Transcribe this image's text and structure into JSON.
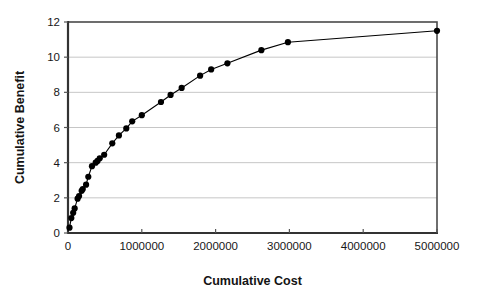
{
  "chart_data": {
    "type": "scatter",
    "title": "",
    "xlabel": "Cumulative Cost",
    "ylabel": "Cumulative Benefit",
    "xlim": [
      0,
      5000000
    ],
    "ylim": [
      0,
      12
    ],
    "xticks": [
      0,
      1000000,
      2000000,
      3000000,
      4000000,
      5000000
    ],
    "yticks": [
      0,
      2,
      4,
      6,
      8,
      10,
      12
    ],
    "xtick_labels": [
      "0",
      "1000000",
      "2000000",
      "3000000",
      "4000000",
      "5000000"
    ],
    "ytick_labels": [
      "0",
      "2",
      "4",
      "6",
      "8",
      "10",
      "12"
    ],
    "grid": "horizontal",
    "legend": "none",
    "marker": "filled-circle",
    "marker_color": "#000000",
    "line_color": "#000000",
    "plot_background": "#ffffff",
    "gridline_color": "#b8b8b8",
    "border_color": "#4a4a4a",
    "series": [
      {
        "name": "Cumulative Benefit",
        "points": [
          [
            20000,
            0.3
          ],
          [
            45000,
            0.85
          ],
          [
            70000,
            1.15
          ],
          [
            90000,
            1.4
          ],
          [
            130000,
            1.95
          ],
          [
            150000,
            2.1
          ],
          [
            185000,
            2.4
          ],
          [
            200000,
            2.5
          ],
          [
            245000,
            2.75
          ],
          [
            275000,
            3.2
          ],
          [
            325000,
            3.8
          ],
          [
            375000,
            4.0
          ],
          [
            400000,
            4.1
          ],
          [
            430000,
            4.25
          ],
          [
            490000,
            4.45
          ],
          [
            600000,
            5.1
          ],
          [
            690000,
            5.55
          ],
          [
            790000,
            5.95
          ],
          [
            870000,
            6.35
          ],
          [
            1000000,
            6.7
          ],
          [
            1260000,
            7.45
          ],
          [
            1390000,
            7.85
          ],
          [
            1540000,
            8.25
          ],
          [
            1790000,
            8.95
          ],
          [
            1940000,
            9.3
          ],
          [
            2160000,
            9.65
          ],
          [
            2620000,
            10.4
          ],
          [
            2980000,
            10.85
          ],
          [
            5000000,
            11.5
          ]
        ]
      }
    ]
  },
  "axes": {
    "y_title": "Cumulative Benefit",
    "x_title": "Cumulative Cost"
  }
}
